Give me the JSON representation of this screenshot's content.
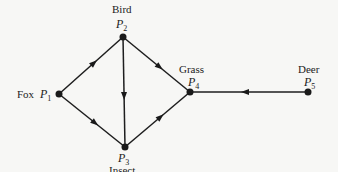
{
  "diagram": {
    "type": "food-web-digraph",
    "nodes": [
      {
        "id": "P1",
        "label": "Fox",
        "symbol": "P",
        "subscript": "1"
      },
      {
        "id": "P2",
        "label": "Bird",
        "symbol": "P",
        "subscript": "2"
      },
      {
        "id": "P3",
        "label": "Insect",
        "symbol": "P",
        "subscript": "3"
      },
      {
        "id": "P4",
        "label": "Grass",
        "symbol": "P",
        "subscript": "4"
      },
      {
        "id": "P5",
        "label": "Deer",
        "symbol": "P",
        "subscript": "5"
      }
    ],
    "edges": [
      {
        "from": "P1",
        "to": "P2"
      },
      {
        "from": "P1",
        "to": "P3"
      },
      {
        "from": "P2",
        "to": "P3"
      },
      {
        "from": "P2",
        "to": "P4"
      },
      {
        "from": "P3",
        "to": "P4"
      },
      {
        "from": "P5",
        "to": "P4"
      }
    ],
    "colors": {
      "ink": "#1a1a1a",
      "background": "#f7f7f5"
    }
  }
}
